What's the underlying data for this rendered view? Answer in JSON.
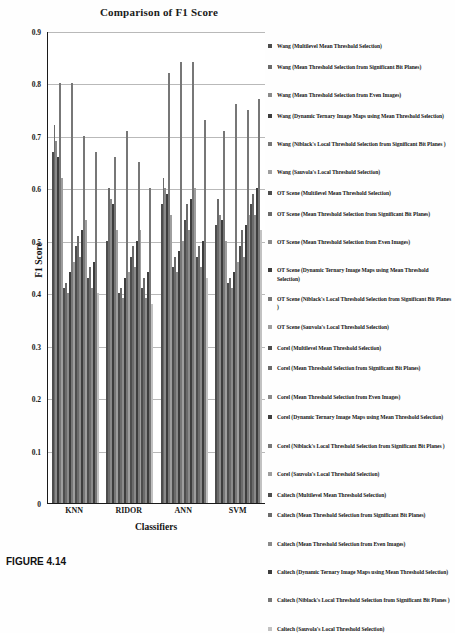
{
  "caption": "FIGURE 4.14",
  "chart_data": {
    "type": "bar",
    "title": "Comparison of F1 Score",
    "xlabel": "Classifiers",
    "ylabel": "F1 Score",
    "ylim": [
      0,
      0.9
    ],
    "ytick_labels": [
      "0",
      "0.1",
      "0.2",
      "0.3",
      "0.4",
      "0.5",
      "0.6",
      "0.7",
      "0.8",
      "0.9"
    ],
    "ytick_values": [
      0,
      0.1,
      0.2,
      0.3,
      0.4,
      0.5,
      0.6,
      0.7,
      0.8,
      0.9
    ],
    "grid": true,
    "legend_position": "right",
    "categories": [
      "KNN",
      "RIDOR",
      "ANN",
      "SVM"
    ],
    "series": [
      {
        "name": "Wang (Multilevel Mean Threshold Selection)",
        "color": "#4d4d4d",
        "values": [
          0.67,
          0.5,
          0.57,
          0.53
        ]
      },
      {
        "name": "Wang (Mean Threshold Selection from Significant Bit Planes)",
        "color": "#6b6b6b",
        "values": [
          0.72,
          0.6,
          0.62,
          0.58
        ]
      },
      {
        "name": "Wang (Mean Threshold Selection from Even Images)",
        "color": "#8a8a8a",
        "values": [
          0.69,
          0.58,
          0.6,
          0.55
        ]
      },
      {
        "name": "Wang (Dynamic Ternary Image Maps using Mean Threshold Selection)",
        "color": "#3d3d3d",
        "values": [
          0.66,
          0.57,
          0.59,
          0.54
        ]
      },
      {
        "name": "Wang (Niblack's Local Threshold Selection from Significant Bit Planes )",
        "color": "#777777",
        "values": [
          0.8,
          0.66,
          0.82,
          0.71
        ]
      },
      {
        "name": "Wang (Sauvola's Local Threshold Selection)",
        "color": "#9e9e9e",
        "values": [
          0.62,
          0.52,
          0.55,
          0.5
        ]
      },
      {
        "name": "OT Scene (Multilevel Mean Threshold Selection)",
        "color": "#4d4d4d",
        "values": [
          0.41,
          0.4,
          0.45,
          0.42
        ]
      },
      {
        "name": "OT Scene (Mean Threshold Selection from Significant Bit Planes)",
        "color": "#6b6b6b",
        "values": [
          0.42,
          0.41,
          0.47,
          0.43
        ]
      },
      {
        "name": "OT Scene (Mean Threshold Selection from Even Images)",
        "color": "#8a8a8a",
        "values": [
          0.4,
          0.39,
          0.44,
          0.41
        ]
      },
      {
        "name": "OT Scene (Dynamic Ternary Image Maps using Mean Threshold Selection)",
        "color": "#3d3d3d",
        "values": [
          0.44,
          0.43,
          0.48,
          0.44
        ]
      },
      {
        "name": "OT Scene (Niblack's Local Threshold Selection from Significant Bit Planes )",
        "color": "#777777",
        "values": [
          0.8,
          0.71,
          0.84,
          0.76
        ]
      },
      {
        "name": "OT Scene (Sauvola's Local Threshold Selection)",
        "color": "#9e9e9e",
        "values": [
          0.46,
          0.44,
          0.5,
          0.46
        ]
      },
      {
        "name": "Corel (Multilevel Mean Threshold Selection)",
        "color": "#4d4d4d",
        "values": [
          0.49,
          0.47,
          0.54,
          0.49
        ]
      },
      {
        "name": "Corel (Mean Threshold Selection from Significant Bit Planes)",
        "color": "#6b6b6b",
        "values": [
          0.51,
          0.49,
          0.57,
          0.52
        ]
      },
      {
        "name": "Corel (Mean Threshold Selection from Even Images)",
        "color": "#8a8a8a",
        "values": [
          0.47,
          0.45,
          0.52,
          0.47
        ]
      },
      {
        "name": "Corel (Dynamic Ternary Image Maps using Mean Threshold Selection)",
        "color": "#3d3d3d",
        "values": [
          0.52,
          0.5,
          0.58,
          0.53
        ]
      },
      {
        "name": "Corel (Niblack's Local Threshold Selection from Significant Bit Planes )",
        "color": "#777777",
        "values": [
          0.7,
          0.65,
          0.84,
          0.75
        ]
      },
      {
        "name": "Corel (Sauvola's Local Threshold Selection)",
        "color": "#9e9e9e",
        "values": [
          0.54,
          0.52,
          0.6,
          0.55
        ]
      },
      {
        "name": "Caltech (Multilevel Mean Threshold Selection)",
        "color": "#4d4d4d",
        "values": [
          0.43,
          0.41,
          0.47,
          0.57
        ]
      },
      {
        "name": "Caltech (Mean Threshold Selection from Significant Bit Planes)",
        "color": "#6b6b6b",
        "values": [
          0.45,
          0.43,
          0.49,
          0.59
        ]
      },
      {
        "name": "Caltech (Mean Threshold Selection from Even Images)",
        "color": "#8a8a8a",
        "values": [
          0.41,
          0.39,
          0.45,
          0.55
        ]
      },
      {
        "name": "Caltech (Dynamic Ternary Image Maps using Mean Threshold Selection)",
        "color": "#3d3d3d",
        "values": [
          0.46,
          0.44,
          0.5,
          0.6
        ]
      },
      {
        "name": "Caltech (Niblack's Local Threshold Selection from Significant Bit Planes )",
        "color": "#777777",
        "values": [
          0.67,
          0.6,
          0.73,
          0.77
        ]
      },
      {
        "name": "Caltech (Sauvola's Local Threshold Selection)",
        "color": "#c2c2c2",
        "values": [
          0.4,
          0.38,
          0.43,
          0.52
        ]
      }
    ]
  }
}
